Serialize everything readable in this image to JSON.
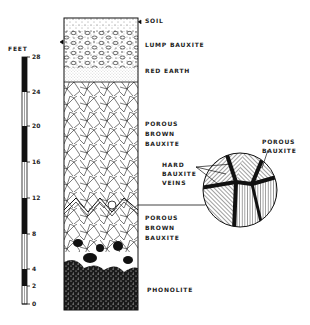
{
  "scale": {
    "unit_label": "FEET",
    "ticks": [
      {
        "value": "28",
        "y": 57
      },
      {
        "value": "24",
        "y": 92
      },
      {
        "value": "20",
        "y": 126
      },
      {
        "value": "16",
        "y": 162
      },
      {
        "value": "12",
        "y": 198
      },
      {
        "value": "8",
        "y": 234
      },
      {
        "value": "4",
        "y": 269
      },
      {
        "value": "2",
        "y": 286
      },
      {
        "value": "0",
        "y": 304
      }
    ]
  },
  "layers": [
    {
      "label_lines": [
        "SOIL"
      ],
      "label_y": 20
    },
    {
      "label_lines": [
        "LUMP BAUXITE"
      ],
      "label_y": 44
    },
    {
      "label_lines": [
        "RED EARTH"
      ],
      "label_y": 70
    },
    {
      "label_lines": [
        "POROUS",
        "BROWN",
        "BAUXITE"
      ],
      "label_y": 121
    },
    {
      "label_lines": [
        "POROUS",
        "BROWN",
        "BAUXITE"
      ],
      "label_y": 214
    },
    {
      "label_lines": [
        "PHONOLITE"
      ],
      "label_y": 286
    }
  ],
  "inset": {
    "label_porous": [
      "POROUS",
      "BAUXITE"
    ],
    "label_veins": [
      "HARD",
      "BAUXITE",
      "VEINS"
    ]
  },
  "colors": {
    "ink": "#111111",
    "paper": "#ffffff"
  }
}
